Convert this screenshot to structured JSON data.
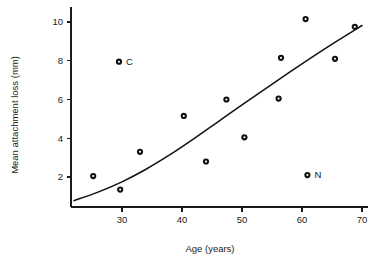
{
  "chart_data": {
    "type": "scatter",
    "title": "",
    "xlabel": "Age (years)",
    "ylabel": "Mean attachment loss (mm)",
    "xlim": [
      21.5,
      71
    ],
    "ylim": [
      0,
      10.8
    ],
    "xticks": [
      30,
      40,
      50,
      60,
      70
    ],
    "xtick_labels": [
      "30",
      "40",
      "50",
      "60",
      "70"
    ],
    "yticks": [
      2,
      4,
      6,
      8,
      10
    ],
    "ytick_labels": [
      "2",
      "4",
      "6",
      "8",
      "10"
    ],
    "grid": false,
    "legend": "none",
    "points": [
      {
        "x": 25.2,
        "y": 2.05,
        "label": ""
      },
      {
        "x": 29.7,
        "y": 1.35,
        "label": ""
      },
      {
        "x": 29.5,
        "y": 7.95,
        "label": "C"
      },
      {
        "x": 33.0,
        "y": 3.3,
        "label": ""
      },
      {
        "x": 40.3,
        "y": 5.15,
        "label": ""
      },
      {
        "x": 44.0,
        "y": 2.8,
        "label": ""
      },
      {
        "x": 47.4,
        "y": 6.0,
        "label": ""
      },
      {
        "x": 50.4,
        "y": 4.05,
        "label": ""
      },
      {
        "x": 56.1,
        "y": 6.05,
        "label": ""
      },
      {
        "x": 56.5,
        "y": 8.15,
        "label": ""
      },
      {
        "x": 60.6,
        "y": 10.15,
        "label": ""
      },
      {
        "x": 60.9,
        "y": 2.1,
        "label": "N"
      },
      {
        "x": 65.5,
        "y": 8.1,
        "label": ""
      },
      {
        "x": 68.8,
        "y": 9.75,
        "label": ""
      }
    ],
    "fit_curve": {
      "name": "fitted trend",
      "x": [
        22.0,
        26.0,
        30.0,
        34.0,
        38.0,
        42.0,
        46.0,
        50.0,
        54.0,
        58.0,
        62.0,
        66.0,
        70.0
      ],
      "y": [
        0.78,
        1.22,
        1.75,
        2.4,
        3.15,
        3.98,
        4.85,
        5.72,
        6.58,
        7.42,
        8.25,
        9.05,
        9.82
      ]
    },
    "annotations": [
      {
        "text": "C",
        "x": 29.5,
        "y": 7.95
      },
      {
        "text": "N",
        "x": 60.9,
        "y": 2.1
      }
    ],
    "colors": {
      "point": "#111111",
      "curve": "#111111",
      "axis": "#1a1a1a",
      "background": "#ffffff"
    }
  }
}
